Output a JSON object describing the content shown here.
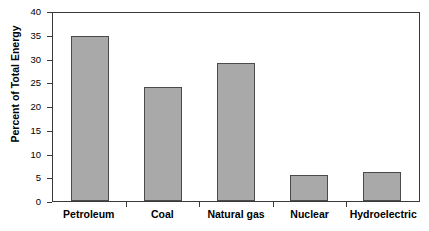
{
  "chart_data": {
    "type": "bar",
    "title": "",
    "xlabel": "",
    "ylabel": "Percent of Total Energy",
    "categories": [
      "Petroleum",
      "Coal",
      "Natural gas",
      "Nuclear",
      "Hydroelectric"
    ],
    "values": [
      34.8,
      24.0,
      29.0,
      5.4,
      6.1
    ],
    "ylim": [
      0,
      40
    ],
    "yticks": [
      0,
      5,
      10,
      15,
      20,
      25,
      30,
      35,
      40
    ],
    "ytick_labels": [
      "0",
      "5",
      "10",
      "15",
      "20",
      "25",
      "30",
      "35",
      "40"
    ],
    "grid": false,
    "legend": null,
    "bar_color": "#a9a9a9",
    "bar_edge_color": "#4a4a4a",
    "axis_color": "#3a3a3a",
    "background_color": "#ffffff"
  }
}
